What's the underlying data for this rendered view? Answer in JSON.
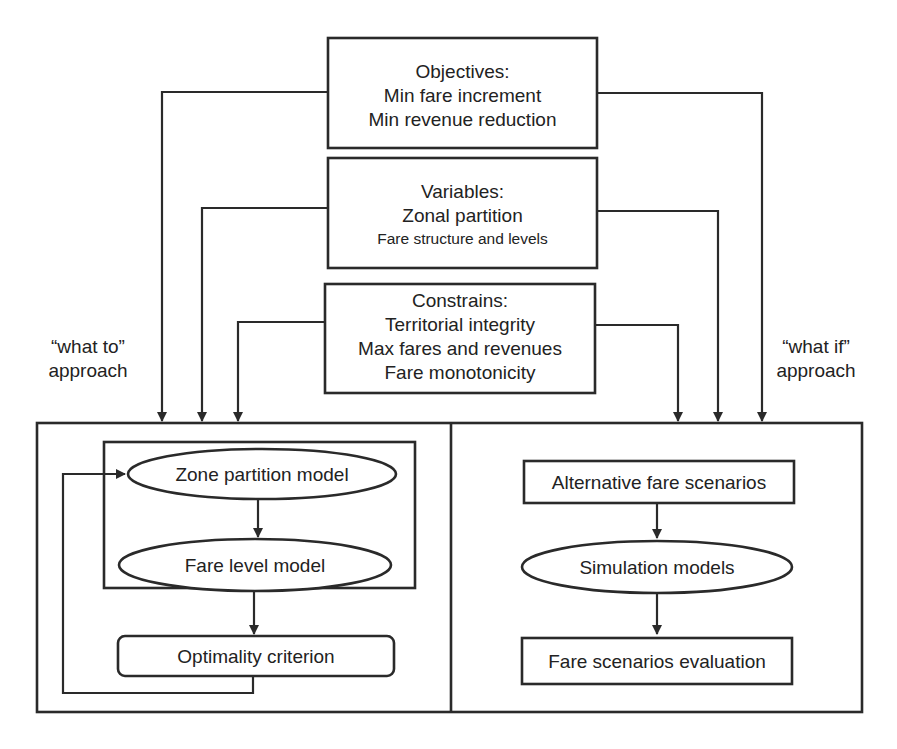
{
  "diagram": {
    "colors": {
      "line": "#2a2a2a",
      "text": "#222222",
      "background": "#ffffff"
    },
    "top_boxes": [
      {
        "id": "objectives",
        "lines": [
          "Objectives:",
          "Min fare increment",
          "Min revenue reduction"
        ]
      },
      {
        "id": "variables",
        "lines": [
          "Variables:",
          "Zonal partition",
          "Fare structure and levels"
        ]
      },
      {
        "id": "constrains",
        "lines": [
          "Constrains:",
          "Territorial integrity",
          "Max fares and revenues",
          "Fare monotonicity"
        ]
      }
    ],
    "approach_labels": {
      "left": [
        "“what to”",
        "approach"
      ],
      "right": [
        "“what if”",
        "approach"
      ]
    },
    "left_panel": {
      "nodes": [
        {
          "id": "zone-partition-model",
          "shape": "ellipse",
          "label": "Zone partition model"
        },
        {
          "id": "fare-level-model",
          "shape": "ellipse",
          "label": "Fare level model"
        },
        {
          "id": "optimality-criterion",
          "shape": "rounded-rect",
          "label": "Optimality criterion"
        }
      ],
      "edges": [
        {
          "from": "zone-partition-model",
          "to": "fare-level-model"
        },
        {
          "from": "fare-level-model",
          "to": "optimality-criterion"
        },
        {
          "from": "optimality-criterion",
          "to": "zone-partition-model",
          "type": "feedback-loop"
        }
      ]
    },
    "right_panel": {
      "nodes": [
        {
          "id": "alternative-fare-scenarios",
          "shape": "rect",
          "label": "Alternative fare scenarios"
        },
        {
          "id": "simulation-models",
          "shape": "ellipse",
          "label": "Simulation models"
        },
        {
          "id": "fare-scenarios-evaluation",
          "shape": "rect",
          "label": "Fare scenarios evaluation"
        }
      ],
      "edges": [
        {
          "from": "alternative-fare-scenarios",
          "to": "simulation-models"
        },
        {
          "from": "simulation-models",
          "to": "fare-scenarios-evaluation"
        }
      ]
    },
    "top_edges": [
      {
        "from": "objectives",
        "to": "left_panel"
      },
      {
        "from": "variables",
        "to": "left_panel"
      },
      {
        "from": "constrains",
        "to": "left_panel"
      },
      {
        "from": "objectives",
        "to": "right_panel"
      },
      {
        "from": "variables",
        "to": "right_panel"
      },
      {
        "from": "constrains",
        "to": "right_panel"
      }
    ]
  }
}
